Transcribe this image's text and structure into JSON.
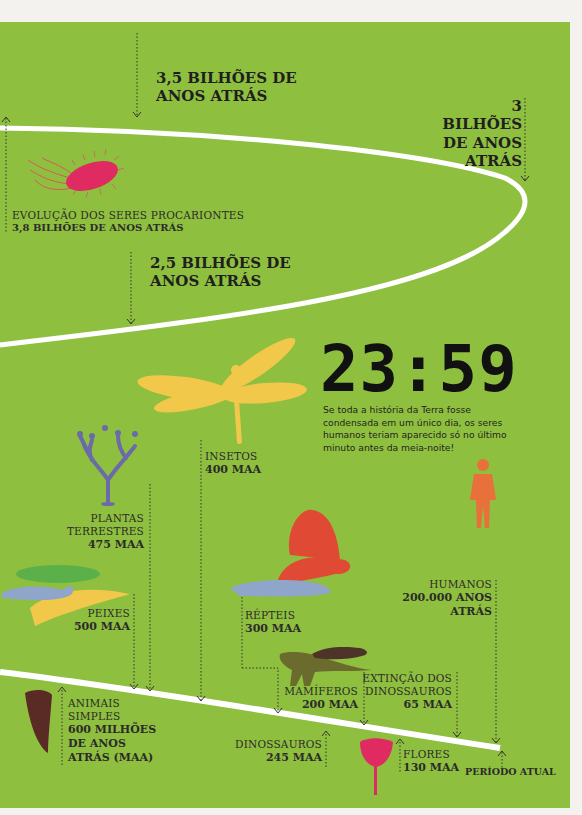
{
  "title_clock": "23:59",
  "clock_description": "Se toda a história da Terra fosse condensada em um único dia, os seres humanos teriam aparecido só no último minuto antes da meia-noite!",
  "colors": {
    "background": "#8fbf3f",
    "timeline": "#ffffff",
    "text": "#2b2b2b"
  },
  "milestones": {
    "b35": {
      "line1": "3,5 BILHÕES DE",
      "line2": "ANOS ATRÁS"
    },
    "b3": {
      "line1": "3 BILHÕES",
      "line2": "DE ANOS",
      "line3": "ATRÁS"
    },
    "b25": {
      "line1": "2,5 BILHÕES DE",
      "line2": "ANOS ATRÁS"
    },
    "procariontes": {
      "title": "EVOLUÇÃO DOS SERES PROCARIONTES",
      "age": "3,8 BILHÕES DE ANOS ATRÁS"
    },
    "insetos": {
      "title": "INSETOS",
      "age": "400 MAA"
    },
    "plantas": {
      "title1": "PLANTAS",
      "title2": "TERRESTRES",
      "age": "475 MAA"
    },
    "peixes": {
      "title": "PEIXES",
      "age": "500 MAA"
    },
    "repteis": {
      "title": "RÉPTEIS",
      "age": "300 MAA"
    },
    "humanos": {
      "title": "HUMANOS",
      "age1": "200.000 ANOS",
      "age2": "ATRÁS"
    },
    "animais": {
      "title1": "ANIMAIS",
      "title2": "SIMPLES",
      "age1": "600 MILHÕES",
      "age2": "DE ANOS",
      "age3": "ATRÁS (MAA)"
    },
    "mamiferos": {
      "title": "MAMÍFEROS",
      "age": "200 MAA"
    },
    "extincao": {
      "title1": "EXTINÇÃO DOS",
      "title2": "DINOSSAUROS",
      "age": "65 MAA"
    },
    "dinossauros": {
      "title": "DINOSSAUROS",
      "age": "245 MAA"
    },
    "flores": {
      "title": "FLORES",
      "age": "130 MAA"
    },
    "atual": {
      "title": "PERÍODO ATUAL"
    }
  }
}
